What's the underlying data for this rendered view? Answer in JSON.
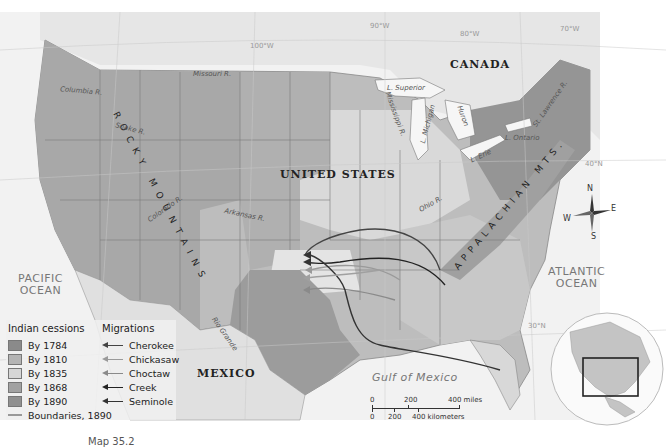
{
  "map": {
    "countries": {
      "us": "UNITED STATES",
      "canada": "CANADA",
      "mexico": "MEXICO"
    },
    "oceans": {
      "pacific": [
        "PACIFIC",
        "OCEAN"
      ],
      "atlantic": [
        "ATLANTIC",
        "OCEAN"
      ],
      "gulf": "Gulf of Mexico"
    },
    "mountains": {
      "rocky": "ROCKY MOUNTAINS",
      "appalachian": "APPALACHIAN MTS."
    },
    "rivers": {
      "columbia": "Columbia R.",
      "snake": "Snake R.",
      "missouri": "Missouri R.",
      "colorado": "Colorado R.",
      "arkansas": "Arkansas R.",
      "rio_grande": "Rio Grande",
      "mississippi": "Mississippi R.",
      "ohio": "Ohio R.",
      "st_lawrence": "St. Lawrence R."
    },
    "lakes": {
      "superior": "L. Superior",
      "michigan": "L. Michigan",
      "huron": "Huron",
      "erie": "L. Erie",
      "ontario": "L. Ontario"
    },
    "graticule": {
      "lon_110": "110°W",
      "lon_100": "100°W",
      "lon_90": "90°W",
      "lon_80": "80°W",
      "lon_70": "70°W",
      "lat_40": "40°N",
      "lat_30": "30°N"
    },
    "compass": {
      "n": "N",
      "s": "S",
      "e": "E",
      "w": "W"
    }
  },
  "legend": {
    "cessions_title": "Indian cessions",
    "migrations_title": "Migrations",
    "cessions": [
      {
        "label": "By 1784",
        "color": "#8a8a8a"
      },
      {
        "label": "By 1810",
        "color": "#b4b4b4"
      },
      {
        "label": "By 1835",
        "color": "#d6d6d6"
      },
      {
        "label": "By 1868",
        "color": "#a2a2a2"
      },
      {
        "label": "By 1890",
        "color": "#909090"
      }
    ],
    "migrations": [
      {
        "label": "Cherokee",
        "color": "#444444"
      },
      {
        "label": "Chickasaw",
        "color": "#9a9a9a"
      },
      {
        "label": "Choctaw",
        "color": "#8a8a8a"
      },
      {
        "label": "Creek",
        "color": "#222222"
      },
      {
        "label": "Seminole",
        "color": "#333333"
      }
    ],
    "boundaries": "Boundaries, 1890"
  },
  "scale": {
    "miles": [
      "0",
      "200",
      "400 miles"
    ],
    "km": [
      "0",
      "200",
      "400 kilometers"
    ]
  },
  "caption": "Map 35.2"
}
